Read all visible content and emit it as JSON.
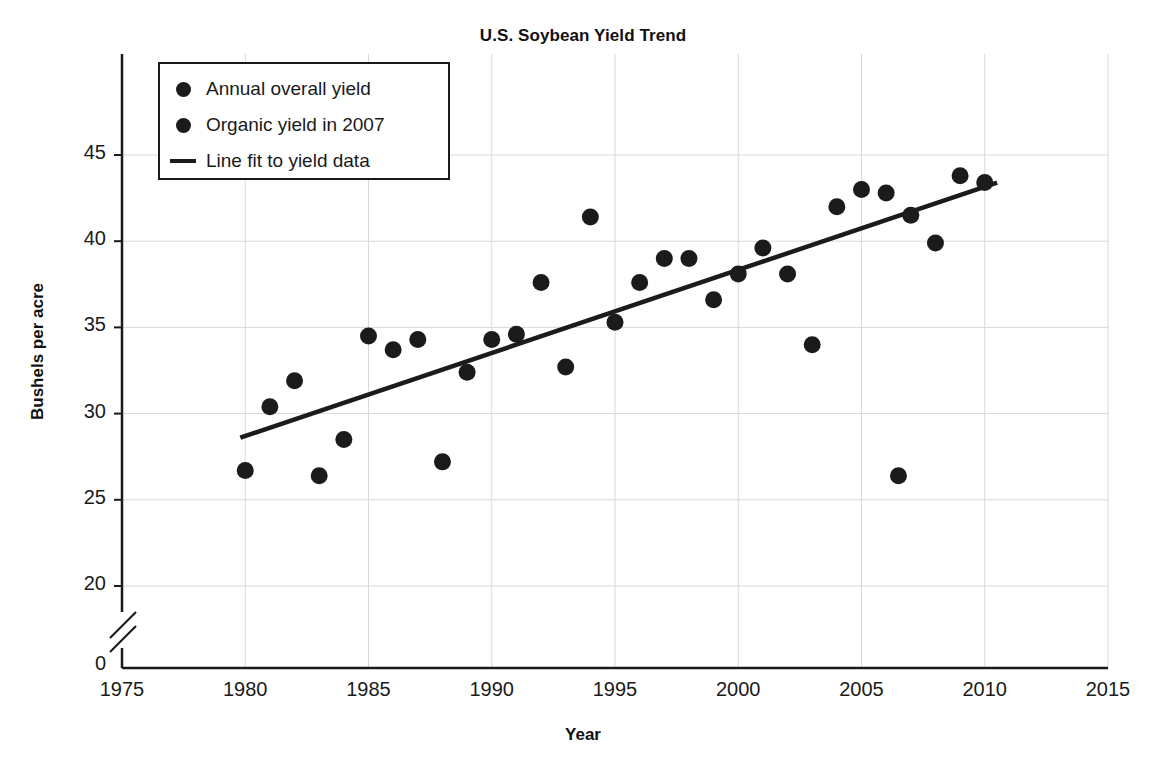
{
  "chart_data": {
    "type": "scatter",
    "title": "U.S. Soybean Yield Trend",
    "xlabel": "Year",
    "ylabel": "Bushels per acre",
    "xlim": [
      1975,
      2015
    ],
    "ylim": [
      20,
      47.5
    ],
    "y_axis_break": true,
    "y_break_below": 20,
    "y_zero_label": "0",
    "grid": true,
    "legend_position": "top-left",
    "xticks": [
      1975,
      1980,
      1985,
      1990,
      1995,
      2000,
      2005,
      2010,
      2015
    ],
    "xtick_labels": [
      "1975",
      "1980",
      "1985",
      "1990",
      "1995",
      "2000",
      "2005",
      "2010",
      "2015"
    ],
    "yticks": [
      20,
      25,
      30,
      35,
      40,
      45
    ],
    "ytick_labels": [
      "20",
      "25",
      "30",
      "35",
      "40",
      "45"
    ],
    "legend": [
      {
        "label": "Annual overall yield",
        "marker": "circle",
        "color": "#1b1b1b"
      },
      {
        "label": "Organic yield in 2007",
        "marker": "circle",
        "color": "#1b1b1b"
      },
      {
        "label": "Line fit to yield data",
        "marker": "line",
        "color": "#1b1b1b"
      }
    ],
    "series": [
      {
        "name": "Annual overall yield",
        "marker": "circle",
        "color": "#1b1b1b",
        "points": [
          {
            "x": 1980.0,
            "y": 26.7
          },
          {
            "x": 1981.0,
            "y": 30.4
          },
          {
            "x": 1982.0,
            "y": 31.9
          },
          {
            "x": 1983.0,
            "y": 26.4
          },
          {
            "x": 1984.0,
            "y": 28.5
          },
          {
            "x": 1985.0,
            "y": 34.5
          },
          {
            "x": 1986.0,
            "y": 33.7
          },
          {
            "x": 1987.0,
            "y": 34.3
          },
          {
            "x": 1988.0,
            "y": 27.2
          },
          {
            "x": 1989.0,
            "y": 32.4
          },
          {
            "x": 1990.0,
            "y": 34.3
          },
          {
            "x": 1991.0,
            "y": 34.6
          },
          {
            "x": 1992.0,
            "y": 37.6
          },
          {
            "x": 1993.0,
            "y": 32.7
          },
          {
            "x": 1994.0,
            "y": 41.4
          },
          {
            "x": 1995.0,
            "y": 35.3
          },
          {
            "x": 1996.0,
            "y": 37.6
          },
          {
            "x": 1997.0,
            "y": 39.0
          },
          {
            "x": 1998.0,
            "y": 39.0
          },
          {
            "x": 1999.0,
            "y": 36.6
          },
          {
            "x": 2000.0,
            "y": 38.1
          },
          {
            "x": 2001.0,
            "y": 39.6
          },
          {
            "x": 2002.0,
            "y": 38.1
          },
          {
            "x": 2003.0,
            "y": 34.0
          },
          {
            "x": 2004.0,
            "y": 42.0
          },
          {
            "x": 2005.0,
            "y": 43.0
          },
          {
            "x": 2006.0,
            "y": 42.8
          },
          {
            "x": 2007.0,
            "y": 41.5
          },
          {
            "x": 2008.0,
            "y": 39.9
          },
          {
            "x": 2009.0,
            "y": 43.8
          },
          {
            "x": 2010.0,
            "y": 43.4
          }
        ]
      },
      {
        "name": "Organic yield in 2007",
        "marker": "circle",
        "color": "#1b1b1b",
        "points": [
          {
            "x": 2006.5,
            "y": 26.4
          }
        ]
      }
    ],
    "fit_line": {
      "name": "Line fit to yield data",
      "color": "#1b1b1b",
      "x_start": 1979.8,
      "y_start": 28.6,
      "x_end": 2010.5,
      "y_end": 43.4
    }
  }
}
